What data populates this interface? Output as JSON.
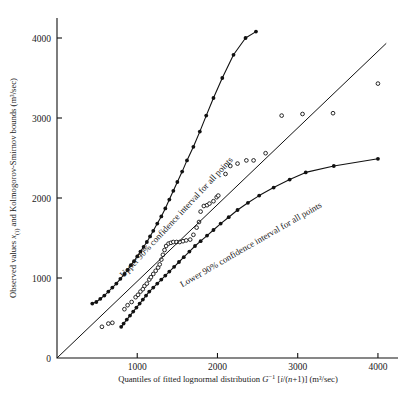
{
  "figure": {
    "name": "lognormal-probability-plot",
    "background": "#ffffff",
    "ink_color": "#111111"
  },
  "chart_data": {
    "type": "scatter",
    "title": "",
    "subtitle": "",
    "xlabel": "Quantiles of fitted lognormal distribution G −1 [i/(n+1)] (m³/sec)",
    "xlabel_parts": {
      "lead": "Quantiles of fitted  lognormal  distribution ",
      "symbol": "G",
      "exponent": "−1",
      "bracket_open": " [",
      "index": "i",
      "slash": "/",
      "denom": "(n",
      "plus": "+1)",
      "bracket_close": "]",
      "units": "  (m³/sec)"
    },
    "ylabel": "Observed values x(i) and Kolmogorov–Smirnov bounds (m³/sec)",
    "ylabel_parts": {
      "lead": "Observed values ",
      "symbol": "x",
      "subscript": "(i)",
      "mid": " and Kolmogorov-Smirnov bounds (m³/sec)"
    },
    "xlim": [
      0,
      4250
    ],
    "ylim": [
      0,
      4250
    ],
    "xticks": [
      0,
      1000,
      2000,
      3000,
      4000
    ],
    "xtick_labels": [
      "",
      "1000",
      "2000",
      "3000",
      "4000"
    ],
    "yticks": [
      0,
      1000,
      2000,
      3000,
      4000
    ],
    "ytick_labels": [
      "0",
      "1000",
      "2000",
      "3000",
      "4000"
    ],
    "grid": false,
    "legend_position": "inline-annotation",
    "series": [
      {
        "name": "Observed values",
        "marker": "open-circle",
        "line": false,
        "points": [
          [
            560,
            390
          ],
          [
            640,
            430
          ],
          [
            690,
            440
          ],
          [
            840,
            610
          ],
          [
            880,
            660
          ],
          [
            930,
            700
          ],
          [
            980,
            760
          ],
          [
            1010,
            790
          ],
          [
            1040,
            830
          ],
          [
            1070,
            860
          ],
          [
            1090,
            900
          ],
          [
            1120,
            930
          ],
          [
            1150,
            980
          ],
          [
            1170,
            1010
          ],
          [
            1200,
            1050
          ],
          [
            1230,
            1090
          ],
          [
            1260,
            1130
          ],
          [
            1280,
            1170
          ],
          [
            1300,
            1230
          ],
          [
            1320,
            1290
          ],
          [
            1340,
            1350
          ],
          [
            1360,
            1400
          ],
          [
            1390,
            1430
          ],
          [
            1420,
            1440
          ],
          [
            1450,
            1450
          ],
          [
            1490,
            1450
          ],
          [
            1530,
            1450
          ],
          [
            1570,
            1460
          ],
          [
            1610,
            1470
          ],
          [
            1660,
            1480
          ],
          [
            1700,
            1540
          ],
          [
            1740,
            1630
          ],
          [
            1770,
            1700
          ],
          [
            1790,
            1830
          ],
          [
            1830,
            1900
          ],
          [
            1870,
            1910
          ],
          [
            1900,
            1930
          ],
          [
            1950,
            1960
          ],
          [
            1990,
            2010
          ],
          [
            2010,
            2030
          ],
          [
            2100,
            2300
          ],
          [
            2160,
            2400
          ],
          [
            2250,
            2430
          ],
          [
            2360,
            2470
          ],
          [
            2450,
            2470
          ],
          [
            2600,
            2560
          ],
          [
            2800,
            3030
          ],
          [
            3060,
            3050
          ],
          [
            3440,
            3060
          ],
          [
            4000,
            3430
          ]
        ]
      },
      {
        "name": "Upper 90% confidence interval for all points",
        "marker": "filled-circle",
        "line": true,
        "points": [
          [
            440,
            680
          ],
          [
            490,
            700
          ],
          [
            540,
            740
          ],
          [
            590,
            780
          ],
          [
            640,
            830
          ],
          [
            690,
            880
          ],
          [
            740,
            930
          ],
          [
            790,
            990
          ],
          [
            840,
            1050
          ],
          [
            880,
            1100
          ],
          [
            920,
            1160
          ],
          [
            960,
            1210
          ],
          [
            1000,
            1270
          ],
          [
            1040,
            1330
          ],
          [
            1080,
            1390
          ],
          [
            1120,
            1450
          ],
          [
            1160,
            1520
          ],
          [
            1200,
            1590
          ],
          [
            1250,
            1680
          ],
          [
            1300,
            1770
          ],
          [
            1350,
            1870
          ],
          [
            1400,
            1980
          ],
          [
            1450,
            2090
          ],
          [
            1500,
            2200
          ],
          [
            1560,
            2330
          ],
          [
            1620,
            2470
          ],
          [
            1700,
            2640
          ],
          [
            1780,
            2830
          ],
          [
            1860,
            3030
          ],
          [
            1950,
            3250
          ],
          [
            2060,
            3500
          ],
          [
            2200,
            3790
          ],
          [
            2350,
            4000
          ],
          [
            2480,
            4080
          ]
        ]
      },
      {
        "name": "Lower 90% confidence interval for all points",
        "marker": "filled-circle",
        "line": true,
        "points": [
          [
            800,
            390
          ],
          [
            830,
            430
          ],
          [
            870,
            480
          ],
          [
            910,
            530
          ],
          [
            950,
            580
          ],
          [
            990,
            630
          ],
          [
            1030,
            680
          ],
          [
            1070,
            730
          ],
          [
            1110,
            780
          ],
          [
            1150,
            830
          ],
          [
            1200,
            880
          ],
          [
            1250,
            930
          ],
          [
            1300,
            980
          ],
          [
            1350,
            1030
          ],
          [
            1400,
            1080
          ],
          [
            1460,
            1140
          ],
          [
            1520,
            1200
          ],
          [
            1580,
            1260
          ],
          [
            1650,
            1330
          ],
          [
            1720,
            1400
          ],
          [
            1790,
            1460
          ],
          [
            1870,
            1530
          ],
          [
            1950,
            1600
          ],
          [
            2040,
            1680
          ],
          [
            2140,
            1760
          ],
          [
            2250,
            1850
          ],
          [
            2380,
            1940
          ],
          [
            2520,
            2030
          ],
          [
            2700,
            2130
          ],
          [
            2900,
            2230
          ],
          [
            3100,
            2320
          ],
          [
            3450,
            2400
          ],
          [
            4000,
            2490
          ]
        ]
      },
      {
        "name": "Reference 45-degree line",
        "marker": "none",
        "line": true,
        "points": [
          [
            0,
            0
          ],
          [
            4100,
            3930
          ]
        ]
      }
    ],
    "annotations": [
      {
        "id": "upper-bound-label",
        "text": "Upper 90% confidence interval for all points",
        "anchor_x": 830,
        "anchor_y": 1000,
        "rotation": -47
      },
      {
        "id": "lower-bound-label",
        "text": "Lower 90% confidence interval for all points",
        "anchor_x": 1560,
        "anchor_y": 880,
        "rotation": -30
      }
    ]
  }
}
